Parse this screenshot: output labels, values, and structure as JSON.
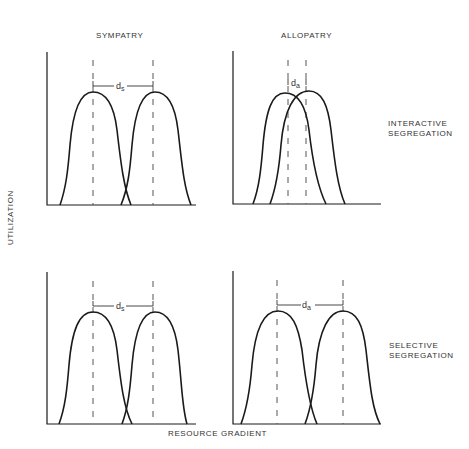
{
  "columns": [
    "SYMPATRY",
    "ALLOPATRY"
  ],
  "rows": [
    "INTERACTIVE\nSEGREGATION",
    "SELECTIVE\nSEGREGATION"
  ],
  "row_labels": {
    "interactive_line1": "INTERACTIVE",
    "interactive_line2": "SEGREGATION",
    "selective_line1": "SELECTIVE",
    "selective_line2": "SEGREGATION"
  },
  "axes": {
    "ylabel": "UTILIZATION",
    "xlabel": "RESOURCE GRADIENT"
  },
  "panels": [
    {
      "id": "top-left",
      "column": "SYMPATRY",
      "row": "INTERACTIVE SEGREGATION",
      "distance_label": "d",
      "distance_sub": "s"
    },
    {
      "id": "top-right",
      "column": "ALLOPATRY",
      "row": "INTERACTIVE SEGREGATION",
      "distance_label": "d",
      "distance_sub": "a"
    },
    {
      "id": "bottom-left",
      "column": "SYMPATRY",
      "row": "SELECTIVE SEGREGATION",
      "distance_label": "d",
      "distance_sub": "s"
    },
    {
      "id": "bottom-right",
      "column": "ALLOPATRY",
      "row": "SELECTIVE SEGREGATION",
      "distance_label": "d",
      "distance_sub": "a"
    }
  ],
  "colors": {
    "line": "#1a1a1a",
    "dash": "#555555"
  }
}
